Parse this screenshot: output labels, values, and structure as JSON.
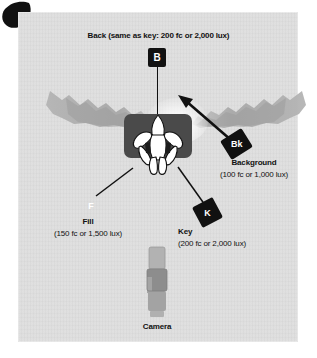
{
  "diagram": {
    "panel_background_color": "#dedede",
    "ink_color": "#111111",
    "platform_color": "#4a4a4a",
    "camera_color": "#9a9a9a"
  },
  "back_light": {
    "marker": "B",
    "caption": "Back (same as key: 200 fc or 2,000 lux)",
    "intensity_fc": "200 fc",
    "intensity_lux": "2,000 lux"
  },
  "background_light": {
    "marker": "Bk",
    "name": "Background",
    "intensity": "(100 fc or 1,000 lux)",
    "intensity_fc": "100 fc",
    "intensity_lux": "1,000 lux"
  },
  "fill_light": {
    "marker": "F",
    "name": "Fill",
    "intensity": "(150 fc or 1,500 lux)",
    "intensity_fc": "150 fc",
    "intensity_lux": "1,500 lux"
  },
  "key_light": {
    "marker": "K",
    "name": "Key",
    "intensity": "(200 fc or 2,000 lux)",
    "intensity_fc": "200 fc",
    "intensity_lux": "2,000 lux"
  },
  "camera": {
    "label": "Camera"
  },
  "subject": {
    "label": "Subject"
  },
  "background_scenery": {
    "label": "Background scenery"
  }
}
